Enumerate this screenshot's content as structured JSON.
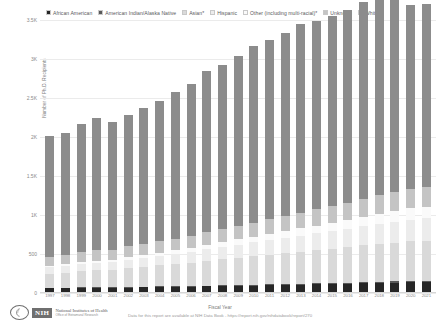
{
  "chart": {
    "type": "bar",
    "yaxis_title": "Number of Ph.D. Recipients",
    "xaxis_title": "Fiscal Year",
    "source_note": "Data for this report are available at NIH Data Book - https://report.nih.gov/nihdatabook/report/270"
  },
  "legend": {
    "items": [
      {
        "label": "African American",
        "color": "#262626"
      },
      {
        "label": "American Indian/Alaska Native",
        "color": "#595959"
      },
      {
        "label": "Asian*",
        "color": "#d9d9d9"
      },
      {
        "label": "Hispanic",
        "color": "#ececec"
      },
      {
        "label": "Other (including multi-racial)*",
        "color": "#fafafa"
      },
      {
        "label": "Unknown",
        "color": "#c4c4c4"
      },
      {
        "label": "White",
        "color": "#8c8c8c"
      }
    ]
  },
  "logo": {
    "nih_abbrev": "NIH",
    "line1": "National Institutes of Health",
    "line2": "Office of Extramural Research"
  },
  "chart_data": {
    "type": "bar",
    "stacked": true,
    "title": "",
    "xlabel": "Fiscal Year",
    "ylabel": "Number of Ph.D. Recipients",
    "ylim": [
      0,
      3500
    ],
    "yticks": [
      0,
      500,
      1000,
      1500,
      2000,
      2500,
      3000,
      3500
    ],
    "ytick_labels": [
      "0",
      "500",
      "1K",
      "1.5K",
      "2K",
      "2.5K",
      "3K",
      "3.5K"
    ],
    "grid": true,
    "legend_position": "top",
    "categories": [
      "1997",
      "1998",
      "1999",
      "2000",
      "2001",
      "2002",
      "2003",
      "2004",
      "2005",
      "2006",
      "2007",
      "2008",
      "2009",
      "2010",
      "2011",
      "2012",
      "2013",
      "2014",
      "2015",
      "2016",
      "2017",
      "2018",
      "2019",
      "2020",
      "2021"
    ],
    "series": [
      {
        "name": "African American",
        "color": "#262626",
        "values": [
          60,
          62,
          65,
          68,
          66,
          70,
          72,
          75,
          78,
          80,
          84,
          88,
          92,
          96,
          100,
          104,
          108,
          112,
          116,
          120,
          126,
          130,
          134,
          140,
          142
        ]
      },
      {
        "name": "American Indian/Alaska Native",
        "color": "#595959",
        "values": [
          8,
          8,
          9,
          9,
          9,
          10,
          10,
          10,
          11,
          11,
          11,
          12,
          12,
          12,
          13,
          13,
          13,
          14,
          14,
          14,
          15,
          15,
          15,
          16,
          16
        ]
      },
      {
        "name": "Asian*",
        "color": "#d9d9d9",
        "values": [
          180,
          190,
          205,
          215,
          225,
          240,
          255,
          270,
          285,
          300,
          320,
          335,
          350,
          365,
          380,
          395,
          410,
          425,
          440,
          455,
          470,
          485,
          495,
          505,
          510
        ]
      },
      {
        "name": "Hispanic",
        "color": "#ececec",
        "values": [
          80,
          85,
          90,
          95,
          100,
          108,
          115,
          122,
          130,
          138,
          148,
          156,
          165,
          175,
          185,
          195,
          205,
          215,
          225,
          235,
          248,
          258,
          268,
          280,
          288
        ]
      },
      {
        "name": "Other (including multi-racial)*",
        "color": "#fafafa",
        "values": [
          20,
          22,
          24,
          26,
          28,
          32,
          36,
          40,
          45,
          50,
          56,
          62,
          68,
          74,
          80,
          86,
          92,
          98,
          105,
          112,
          120,
          128,
          136,
          144,
          150
        ]
      },
      {
        "name": "Unknown",
        "color": "#c4c4c4",
        "values": [
          120,
          125,
          130,
          135,
          130,
          138,
          142,
          146,
          150,
          155,
          162,
          168,
          175,
          182,
          188,
          195,
          202,
          208,
          215,
          222,
          230,
          238,
          244,
          250,
          252
        ]
      },
      {
        "name": "White",
        "color": "#8c8c8c",
        "values": [
          1540,
          1560,
          1640,
          1700,
          1630,
          1690,
          1740,
          1800,
          1880,
          1950,
          2060,
          2100,
          2180,
          2260,
          2300,
          2350,
          2420,
          2420,
          2440,
          2470,
          2520,
          2600,
          2480,
          2360,
          2350
        ]
      }
    ],
    "totals": [
      2008,
      2052,
      2163,
      2248,
      2188,
      2288,
      2370,
      2463,
      2579,
      2684,
      2841,
      2921,
      3042,
      3164,
      3246,
      3338,
      3450,
      3492,
      3555,
      3628,
      3729,
      3854,
      3772,
      3695,
      3708
    ]
  }
}
